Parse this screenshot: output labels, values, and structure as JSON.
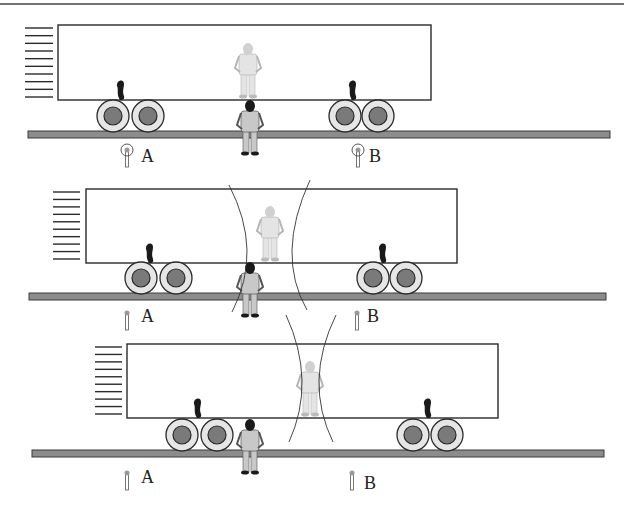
{
  "diagram": {
    "colors": {
      "outline": "#2a2a2a",
      "rail_fill": "#8c8c8c",
      "wheel_hub": "#7a7a7a",
      "wheel_ring": "#e6e6e6",
      "figure_light": "#cfcfcf",
      "figure_dark": "#1a1a1a"
    },
    "top_rule": {
      "y": 4
    },
    "panels": [
      {
        "id": "panel-1",
        "train": {
          "x": 58,
          "y": 25,
          "w": 373,
          "h": 75
        },
        "motion_lines": {
          "x1": 25,
          "x2": 53,
          "y_start": 28,
          "y_end": 97,
          "count": 10
        },
        "wheels": [
          113,
          148,
          345,
          378
        ],
        "wheel_y": 116,
        "rail": {
          "x1": 28,
          "x2": 610,
          "y": 131,
          "h": 7
        },
        "bumps": [
          120,
          352
        ],
        "passenger_x": 248,
        "ground_observer_x": 250,
        "wavefronts": [],
        "lamp_style": "flash",
        "lamps": [
          {
            "label": "A",
            "x": 127,
            "y": 157,
            "label_x": 141,
            "label_y": 147
          },
          {
            "label": "B",
            "x": 358,
            "y": 157,
            "label_x": 369,
            "label_y": 147
          }
        ]
      },
      {
        "id": "panel-2",
        "train": {
          "x": 86,
          "y": 189,
          "w": 371,
          "h": 74
        },
        "motion_lines": {
          "x1": 53,
          "x2": 80,
          "y_start": 192,
          "y_end": 259,
          "count": 10
        },
        "wheels": [
          141,
          176,
          373,
          406
        ],
        "wheel_y": 278,
        "rail": {
          "x1": 29,
          "x2": 606,
          "y": 293,
          "h": 7
        },
        "bumps": [
          149,
          382
        ],
        "passenger_x": 270,
        "ground_observer_x": 250,
        "wavefronts": [
          {
            "side": "left",
            "top": [
              229,
              185
            ],
            "mid": [
              247,
              250
            ],
            "bottom": [
              232,
              312
            ]
          },
          {
            "side": "right",
            "top": [
              310,
              180
            ],
            "mid": [
              292,
              250
            ],
            "bottom": [
              307,
              310
            ]
          }
        ],
        "lamp_style": "plain",
        "lamps": [
          {
            "label": "A",
            "x": 127,
            "y": 320,
            "label_x": 141,
            "label_y": 307
          },
          {
            "label": "B",
            "x": 357,
            "y": 320,
            "label_x": 367,
            "label_y": 307
          }
        ]
      },
      {
        "id": "panel-3",
        "train": {
          "x": 127,
          "y": 344,
          "w": 371,
          "h": 74
        },
        "motion_lines": {
          "x1": 95,
          "x2": 122,
          "y_start": 347,
          "y_end": 414,
          "count": 10
        },
        "wheels": [
          182,
          217,
          413,
          447
        ],
        "wheel_y": 435,
        "rail": {
          "x1": 32,
          "x2": 604,
          "y": 450,
          "h": 7
        },
        "bumps": [
          197,
          427
        ],
        "passenger_x": 310,
        "ground_observer_x": 250,
        "wavefronts": [
          {
            "side": "left",
            "top": [
              286,
              315
            ],
            "mid": [
              302,
              380
            ],
            "bottom": [
              289,
              442
            ]
          },
          {
            "side": "right",
            "top": [
              336,
              315
            ],
            "mid": [
              319,
              380
            ],
            "bottom": [
              333,
              442
            ]
          }
        ],
        "lamp_style": "plain",
        "lamps": [
          {
            "label": "A",
            "x": 127,
            "y": 480,
            "label_x": 141,
            "label_y": 468
          },
          {
            "label": "B",
            "x": 352,
            "y": 480,
            "label_x": 364,
            "label_y": 474
          }
        ]
      }
    ]
  }
}
